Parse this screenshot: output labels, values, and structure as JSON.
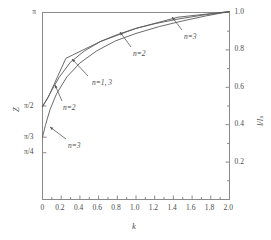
{
  "chart_data": {
    "type": "line",
    "title": "",
    "xlabel": "k",
    "ylabel_left": "Z",
    "ylabel_right": "l/lₛ",
    "xlim": [
      0,
      2.0
    ],
    "ylim_left_labels": [
      "π/4",
      "π/3",
      "π/2",
      "π"
    ],
    "ylim_right": [
      0,
      1.0
    ],
    "grid": false,
    "legend_position": "inline-annotations",
    "xticks": [
      "0",
      "0.2",
      "0.4",
      "0.6",
      "0.8",
      "1.0",
      "1.2",
      "1.4",
      "1.6",
      "1.8",
      "2.0"
    ],
    "xtick_values": [
      0,
      0.2,
      0.4,
      0.6,
      0.8,
      1.0,
      1.2,
      1.4,
      1.6,
      1.8,
      2.0
    ],
    "yticks_left": [
      {
        "label": "π",
        "value": 1.0
      },
      {
        "label": "π/2",
        "value": 0.5
      },
      {
        "label": "π/3",
        "value": 0.3333
      },
      {
        "label": "π/4",
        "value": 0.25
      }
    ],
    "yticks_right": [
      "0.2",
      "0.4",
      "0.6",
      "0.8",
      "1.0"
    ],
    "ytick_right_values": [
      0.2,
      0.4,
      0.6,
      0.8,
      1.0
    ],
    "series": [
      {
        "name": "n=1",
        "style": "piecewise-linear",
        "x": [
          0.0,
          0.06,
          0.25,
          0.62,
          1.0,
          1.45,
          2.0
        ],
        "y": [
          0.5,
          0.545,
          0.755,
          0.845,
          0.915,
          0.975,
          1.005
        ]
      },
      {
        "name": "n=2",
        "style": "curve",
        "x": [
          0.0,
          0.04,
          0.1,
          0.18,
          0.3,
          0.45,
          0.62,
          0.8,
          1.0,
          1.2,
          1.45,
          1.7,
          2.0
        ],
        "y": [
          0.495,
          0.53,
          0.585,
          0.655,
          0.735,
          0.795,
          0.845,
          0.882,
          0.915,
          0.94,
          0.965,
          0.985,
          1.005
        ]
      },
      {
        "name": "n=3",
        "style": "curve",
        "x": [
          0.0,
          0.03,
          0.08,
          0.15,
          0.26,
          0.4,
          0.58,
          0.78,
          1.0,
          1.25,
          1.5,
          1.75,
          2.0
        ],
        "y": [
          0.333,
          0.395,
          0.48,
          0.565,
          0.655,
          0.73,
          0.795,
          0.848,
          0.888,
          0.925,
          0.955,
          0.982,
          1.005
        ]
      }
    ],
    "annotations": [
      {
        "text": "n=1,  3",
        "x_px": 92,
        "y_px": 79
      },
      {
        "text": "n=2",
        "x_px": 63,
        "y_px": 104
      },
      {
        "text": "n=3",
        "x_px": 68,
        "y_px": 142
      },
      {
        "text": "n=2",
        "x_px": 133,
        "y_px": 50
      },
      {
        "text": "n=3",
        "x_px": 184,
        "y_px": 33
      }
    ]
  },
  "axis": {
    "x_name": "k",
    "y_left_name": "Z",
    "y_right_name": "l/lₛ"
  }
}
